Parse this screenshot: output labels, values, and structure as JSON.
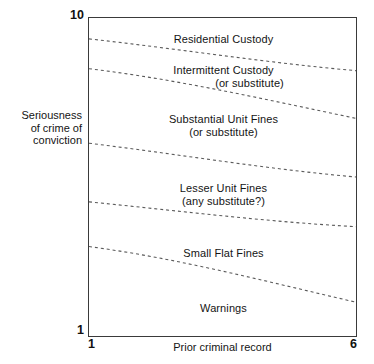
{
  "chart_data": {
    "type": "area",
    "title": "",
    "xlabel": "Prior criminal record",
    "ylabel_lines": [
      "Seriousness",
      "of crime of",
      "conviction"
    ],
    "xlim": [
      1,
      6
    ],
    "ylim": [
      1,
      10
    ],
    "xticks": [
      "1",
      "6"
    ],
    "yticks": [
      "1",
      "10"
    ],
    "grid": false,
    "legend": "none",
    "bands": [
      {
        "id": "residential-custody",
        "line1": "Residential Custody",
        "line2": "",
        "indent_second": false,
        "label_top_frac": 0.047,
        "upper_boundary": "frame-top",
        "lower_boundary": "boundary-1"
      },
      {
        "id": "intermittent-custody",
        "line1": "Intermittent Custody",
        "line2": "(or substitute)",
        "indent_second": true,
        "label_top_frac": 0.145,
        "upper_boundary": "boundary-1",
        "lower_boundary": "boundary-2"
      },
      {
        "id": "substantial-unit-fines",
        "line1": "Substantial Unit Fines",
        "line2": "(or substitute)",
        "indent_second": false,
        "label_top_frac": 0.296,
        "upper_boundary": "boundary-2",
        "lower_boundary": "boundary-3"
      },
      {
        "id": "lesser-unit-fines",
        "line1": "Lesser Unit Fines",
        "line2": "(any substitute?)",
        "indent_second": false,
        "label_top_frac": 0.513,
        "upper_boundary": "boundary-3",
        "lower_boundary": "boundary-4"
      },
      {
        "id": "small-flat-fines",
        "line1": "Small Flat Fines",
        "line2": "",
        "indent_second": false,
        "label_top_frac": 0.716,
        "upper_boundary": "boundary-4",
        "lower_boundary": "boundary-5"
      },
      {
        "id": "warnings",
        "line1": "Warnings",
        "line2": "",
        "indent_second": false,
        "label_top_frac": 0.889,
        "upper_boundary": "boundary-5",
        "lower_boundary": "frame-bottom"
      }
    ],
    "boundary_curves": [
      {
        "id": "boundary-1",
        "x_start": 1.0,
        "y_start": 8.38,
        "x_end": 6.0,
        "y_end": 7.38,
        "path": "M 0,21 C 90,31 178,45 269,53"
      },
      {
        "id": "boundary-2",
        "x_start": 1.0,
        "y_start": 7.53,
        "x_end": 6.0,
        "y_end": 6.03,
        "path": "M 0,51 C 90,62 178,82 269,101"
      },
      {
        "id": "boundary-3",
        "x_start": 1.0,
        "y_start": 5.41,
        "x_end": 6.0,
        "y_end": 4.38,
        "path": "M 0,126 C 90,137 178,152 269,160"
      },
      {
        "id": "boundary-4",
        "x_start": 1.0,
        "y_start": 3.75,
        "x_end": 6.0,
        "y_end": 3.03,
        "path": "M 0,185 C 90,194 178,205 269,210"
      },
      {
        "id": "boundary-5",
        "x_start": 1.0,
        "y_start": 2.47,
        "x_end": 6.0,
        "y_end": 1.31,
        "path": "M 0,230 C 90,242 178,265 269,286"
      }
    ],
    "style": {
      "frame_color": "#3a3a3a",
      "curve_color": "#5a5a5a",
      "text_color": "#141414",
      "background": "#ffffff",
      "dash_pattern": "3 3"
    }
  }
}
